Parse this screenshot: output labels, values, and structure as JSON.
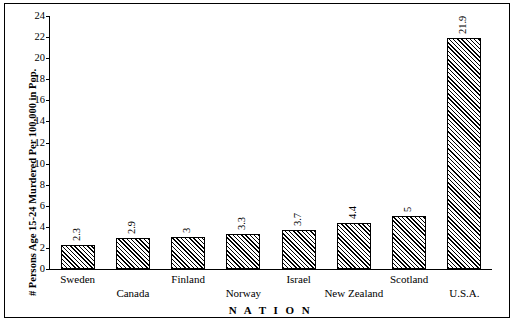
{
  "chart_data": {
    "type": "bar",
    "title": "",
    "xlabel": "N A T I O N",
    "ylabel": "# Persons Age 15-24 Murdered Per 100,000 in Pop.",
    "categories": [
      "Sweden",
      "Canada",
      "Finland",
      "Norway",
      "Israel",
      "New Zealand",
      "Scotland",
      "U.S.A."
    ],
    "values": [
      2.3,
      2.9,
      3,
      3.3,
      3.7,
      4.4,
      5,
      21.9
    ],
    "value_labels": [
      "2.3",
      "2.9",
      "3",
      "3.3",
      "3.7",
      "4.4",
      "5",
      "21.9"
    ],
    "ylim": [
      0,
      24
    ],
    "yticks": [
      0,
      2,
      4,
      6,
      8,
      10,
      12,
      14,
      16,
      18,
      20,
      22,
      24
    ],
    "ytick_labels": [
      "0",
      "2",
      "4",
      "6",
      "8",
      "10",
      "12",
      "14",
      "16",
      "18",
      "20",
      "22",
      "24"
    ],
    "grid": false,
    "legend": false,
    "bar_fill": "#000000",
    "bar_pattern": "diagonal-hatch",
    "border_color": "#000000"
  }
}
